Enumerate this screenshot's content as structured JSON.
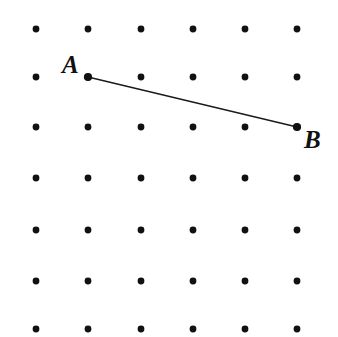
{
  "figure": {
    "background_color": "#ffffff",
    "width": 338,
    "height": 337
  },
  "lattice": {
    "rows": 7,
    "columns": 6,
    "dot_color": "#111111",
    "dot_radius": 3.4,
    "column_x": [
      36,
      88,
      141,
      193,
      245,
      297
    ],
    "row_y": [
      29,
      77,
      127,
      178,
      230,
      281,
      329
    ],
    "x_spacing": 52,
    "y_spacing": 50
  },
  "segment": {
    "name": "AB",
    "color": "#1a1a1a",
    "stroke_width": 1.4,
    "start": {
      "label": "A",
      "x": 88,
      "y": 77,
      "grid_col": 2,
      "grid_row": 2
    },
    "end": {
      "label": "B",
      "x": 297,
      "y": 127,
      "grid_col": 6,
      "grid_row": 3
    },
    "run": 4,
    "rise": 1
  },
  "labels": {
    "a": {
      "text": "A",
      "x": 62,
      "y": 52
    },
    "b": {
      "text": "B",
      "x": 304,
      "y": 127
    }
  },
  "chart_data": {
    "type": "scatter",
    "xlabel": "",
    "ylabel": "",
    "grid": false,
    "xlim": [
      0,
      5
    ],
    "ylim": [
      0,
      6
    ],
    "annotations": [
      "A",
      "B"
    ],
    "series": [
      {
        "name": "lattice-points",
        "x": [
          0,
          1,
          2,
          3,
          4,
          5,
          0,
          1,
          2,
          3,
          4,
          5,
          0,
          1,
          2,
          3,
          4,
          5,
          0,
          1,
          2,
          3,
          4,
          5,
          0,
          1,
          2,
          3,
          4,
          5,
          0,
          1,
          2,
          3,
          4,
          5,
          0,
          1,
          2,
          3,
          4,
          5
        ],
        "y": [
          6,
          6,
          6,
          6,
          6,
          6,
          5,
          5,
          5,
          5,
          5,
          5,
          4,
          4,
          4,
          4,
          4,
          4,
          3,
          3,
          3,
          3,
          3,
          3,
          2,
          2,
          2,
          2,
          2,
          2,
          1,
          1,
          1,
          1,
          1,
          1,
          0,
          0,
          0,
          0,
          0,
          0
        ]
      },
      {
        "name": "segment-AB",
        "x": [
          1,
          5
        ],
        "y": [
          5,
          4
        ]
      }
    ]
  }
}
